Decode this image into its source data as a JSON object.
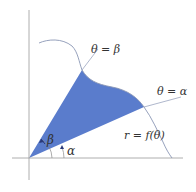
{
  "diagram": {
    "type": "polar-area-region",
    "colors": {
      "background": "#ffffff",
      "region_fill": "#5a7ccc",
      "axis": "#9a9a9a",
      "curve": "#8a96b4",
      "ray": "#9aa4bf",
      "arc": "#8a8a8a",
      "arrow": "#2a3a7a",
      "text": "#333333"
    },
    "labels": {
      "ray_beta": "θ = β",
      "ray_alpha": "θ = α",
      "curve": "r = f(θ)",
      "angle_beta": "β",
      "angle_alpha": "α"
    },
    "geometry": {
      "origin": [
        29,
        158
      ],
      "beta_intersection": [
        82,
        70
      ],
      "alpha_intersection": [
        144,
        107
      ]
    }
  }
}
